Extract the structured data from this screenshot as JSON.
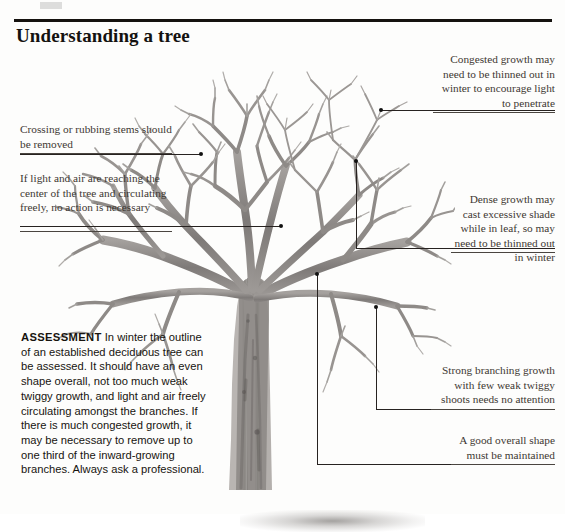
{
  "page": {
    "title": "Understanding a tree",
    "background_color": "#fdfdfc",
    "rule_color": "#15120f"
  },
  "illustration": {
    "name": "bare-deciduous-tree-winter",
    "description": "Black and white photographic illustration of a bare deciduous tree in winter showing trunk, scaffold branches and twiggy growth",
    "branch_color": "#8e8a87",
    "trunk_color": "#767270"
  },
  "annotations": [
    {
      "id": "congested-growth",
      "align": "right",
      "text": "Congested growth may need to be thinned out in winter to encourage light to penetrate"
    },
    {
      "id": "crossing-stems",
      "align": "left",
      "text": "Crossing or rubbing stems should be removed"
    },
    {
      "id": "light-and-air",
      "align": "left",
      "text": "If light and air are reaching the center of the tree and circulating freely, no action is necessary"
    },
    {
      "id": "dense-growth",
      "align": "right",
      "text": "Dense growth may cast excessive shade while in leaf, so may need to be thinned out in winter"
    },
    {
      "id": "strong-branching",
      "align": "right",
      "text": "Strong branching growth with few weak twiggy shoots needs no attention"
    },
    {
      "id": "good-shape",
      "align": "right",
      "text": "A good overall shape must be maintained"
    }
  ],
  "assessment": {
    "heading": "ASSESSMENT",
    "body": " In winter the outline of an established deciduous tree can be assessed. It should have an even shape overall, not too much weak twiggy growth, and light and air freely circulating amongst the branches. If there is much congested growth, it may be necessary to remove up to one third of the inward-growing branches. Always ask a professional."
  }
}
